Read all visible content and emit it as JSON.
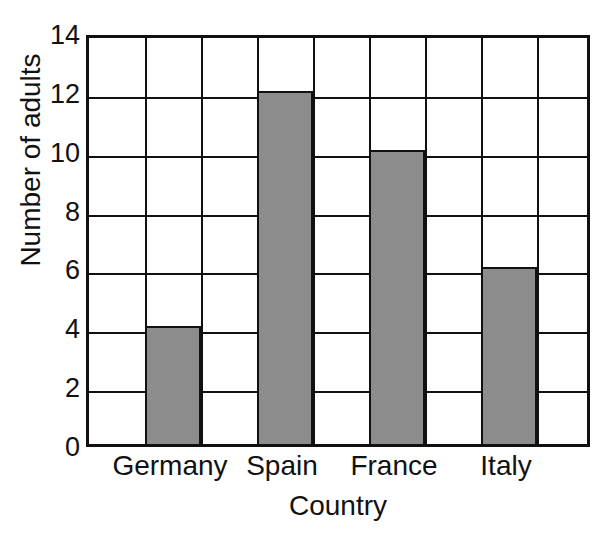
{
  "chart_data": {
    "type": "bar",
    "title": "",
    "title_note": "title cropped off top of image; only letter descenders visible",
    "categories": [
      "Germany",
      "Spain",
      "France",
      "Italy"
    ],
    "values": [
      4,
      12,
      10,
      6
    ],
    "xlabel": "Country",
    "ylabel": "Number of adults",
    "ylim": [
      0,
      14
    ],
    "ytick_step": 2,
    "yticks": [
      "0",
      "2",
      "4",
      "6",
      "8",
      "10",
      "12",
      "14"
    ],
    "grid": "both",
    "grid_columns": 9,
    "grid_rows": 7,
    "bar_columns": [
      2,
      4,
      6,
      8
    ],
    "legend": "none",
    "bar_color": "#8c8c8c",
    "line_color": "#111111",
    "background": "#ffffff"
  },
  "axes": {
    "y_title": "Number of adults",
    "x_title": "Country"
  }
}
